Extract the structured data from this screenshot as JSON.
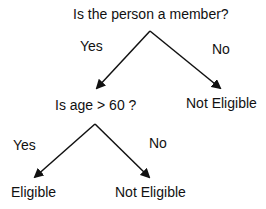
{
  "diagram": {
    "type": "decision-tree",
    "nodes": {
      "root": "Is the person a member?",
      "age_question": "Is age > 60 ?",
      "not_eligible_1": "Not Eligible",
      "eligible": "Eligible",
      "not_eligible_2": "Not Eligible"
    },
    "edges": {
      "root_yes": "Yes",
      "root_no": "No",
      "age_yes": "Yes",
      "age_no": "No"
    },
    "colors": {
      "line": "#111111",
      "text": "#111111",
      "background": "#ffffff"
    }
  }
}
